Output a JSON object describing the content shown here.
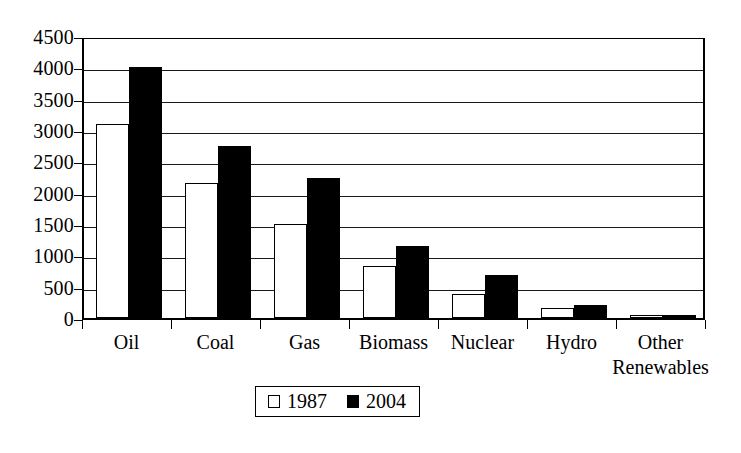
{
  "chart_data": {
    "type": "bar",
    "title": "",
    "subtitle": "",
    "xlabel": "",
    "ylabel": "",
    "categories": [
      "Oil",
      "Coal",
      "Gas",
      "Biomass",
      "Nuclear",
      "Hydro",
      "Other Renewables"
    ],
    "series": [
      {
        "name": "1987",
        "color": "#ffffff",
        "values": [
          3100,
          2150,
          1500,
          830,
          380,
          160,
          20
        ]
      },
      {
        "name": "2004",
        "color": "#000000",
        "values": [
          4000,
          2750,
          2230,
          1150,
          680,
          200,
          40
        ]
      }
    ],
    "ylim": [
      0,
      4500
    ],
    "ytick_labels": [
      "4500",
      "4000",
      "3500",
      "3000",
      "2500",
      "2000",
      "1500",
      "1000",
      "500",
      "0"
    ],
    "ytick_values": [
      4500,
      4000,
      3500,
      3000,
      2500,
      2000,
      1500,
      1000,
      500,
      0
    ],
    "grid": true,
    "legend_position": "bottom-center",
    "legend": [
      {
        "label": "1987",
        "marker": "white-square"
      },
      {
        "label": "2004",
        "marker": "black-square"
      }
    ]
  }
}
